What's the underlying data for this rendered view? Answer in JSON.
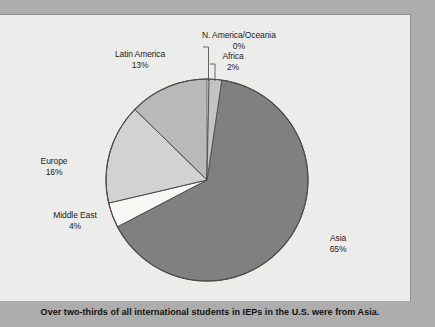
{
  "figure": {
    "caption": "Over two-thirds of all international students in IEPs in the U.S. were from Asia."
  },
  "colors": {
    "asia": "#808080",
    "latin_america": "#b9b9b9",
    "europe": "#d2d2d2",
    "middle_east": "#f7f7f5",
    "africa": "#c4c4c4",
    "north_america_oceania": "#ececeb",
    "panel_bg": "#ececeb",
    "page_bg": "#adadad",
    "outline": "#4a4a4a",
    "leader_line": "#555555"
  },
  "labels": {
    "asia": {
      "name": "Asia",
      "pct": "65%"
    },
    "latin_america": {
      "name": "Latin America",
      "pct": "13%"
    },
    "europe": {
      "name": "Europe",
      "pct": "16%"
    },
    "middle_east": {
      "name": "Middle East",
      "pct": "4%"
    },
    "africa": {
      "name": "Africa",
      "pct": "2%"
    },
    "north_america_oceania": {
      "name": "N. America/Oceania",
      "pct": "0%"
    }
  },
  "chart_data": {
    "type": "pie",
    "title": "",
    "subtitle": "",
    "xlabel": "",
    "ylabel": "",
    "legend_position": "none",
    "grid": false,
    "labels_inline": true,
    "start_angle_deg": 0,
    "direction": "clockwise",
    "categories": [
      "Asia",
      "Middle East",
      "Europe",
      "Latin America",
      "Africa",
      "N. America/Oceania"
    ],
    "values": [
      65,
      4,
      16,
      13,
      2,
      0
    ],
    "value_labels": [
      "65%",
      "4%",
      "16%",
      "13%",
      "2%",
      "0%"
    ],
    "slice_colors": [
      "#808080",
      "#f7f7f5",
      "#d2d2d2",
      "#b9b9b9",
      "#c4c4c4",
      "#ececeb"
    ],
    "units": "percent",
    "annotations": [
      "Over two-thirds of all international students in IEPs in the U.S. were from Asia."
    ]
  }
}
